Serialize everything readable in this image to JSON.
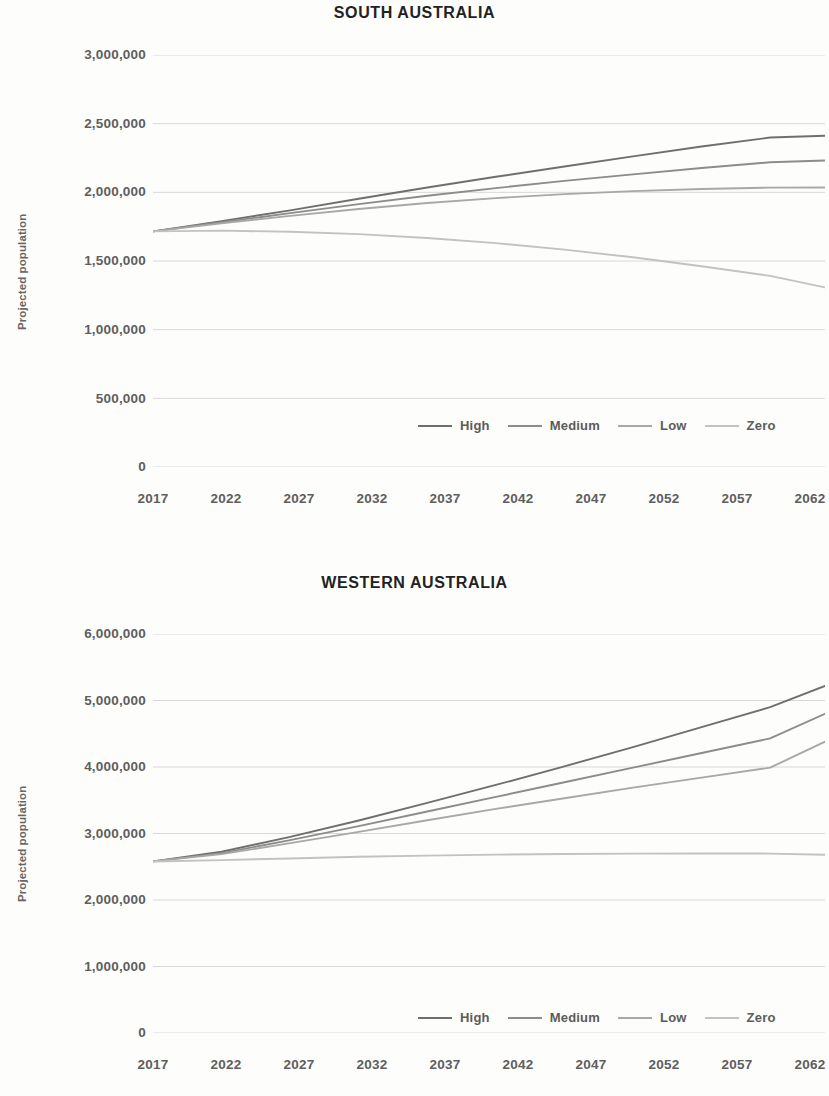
{
  "figure": {
    "background": "#fdfdfc",
    "text_color": "#5e5e5e",
    "title_color": "#222222"
  },
  "series_colors": {
    "High": "#6f6f6f",
    "Medium": "#8c8c8c",
    "Low": "#a8a8a8",
    "Zero": "#c2c2c2"
  },
  "legend": {
    "items": [
      {
        "label": "High",
        "color": "#6f6f6f"
      },
      {
        "label": "Medium",
        "color": "#8c8c8c"
      },
      {
        "label": "Low",
        "color": "#a8a8a8"
      },
      {
        "label": "Zero",
        "color": "#c2c2c2"
      }
    ]
  },
  "chart_data": [
    {
      "type": "line",
      "title": "SOUTH AUSTRALIA",
      "xlabel": "",
      "ylabel": "Projected population",
      "x": [
        2017,
        2022,
        2027,
        2032,
        2037,
        2042,
        2047,
        2052,
        2057,
        2062,
        2066
      ],
      "xticks": [
        "2017",
        "2022",
        "2027",
        "2032",
        "2037",
        "2042",
        "2047",
        "2052",
        "2057",
        "2062"
      ],
      "yticks": [
        "0",
        "500,000",
        "1,000,000",
        "1,500,000",
        "2,000,000",
        "2,500,000",
        "3,000,000"
      ],
      "ytick_values": [
        0,
        500000,
        1000000,
        1500000,
        2000000,
        2500000,
        3000000
      ],
      "xlim": [
        2017,
        2066
      ],
      "ylim": [
        0,
        3000000
      ],
      "grid": true,
      "legend_position": "bottom-center",
      "series": [
        {
          "name": "High",
          "color": "#6f6f6f",
          "values": [
            1716000,
            1790000,
            1869000,
            1953000,
            2035000,
            2113000,
            2188000,
            2262000,
            2334000,
            2399000,
            2412000
          ]
        },
        {
          "name": "Medium",
          "color": "#8c8c8c",
          "values": [
            1716000,
            1782000,
            1849000,
            1914000,
            1975000,
            2031000,
            2083000,
            2131000,
            2177000,
            2219000,
            2232000
          ]
        },
        {
          "name": "Low",
          "color": "#a8a8a8",
          "values": [
            1716000,
            1774000,
            1829000,
            1879000,
            1922000,
            1958000,
            1987000,
            2009000,
            2024000,
            2034000,
            2035000
          ]
        },
        {
          "name": "Zero",
          "color": "#c2c2c2",
          "values": [
            1716000,
            1721000,
            1713000,
            1696000,
            1668000,
            1630000,
            1583000,
            1527000,
            1462000,
            1392000,
            1308000
          ]
        }
      ]
    },
    {
      "type": "line",
      "title": "WESTERN AUSTRALIA",
      "xlabel": "",
      "ylabel": "Projected population",
      "x": [
        2017,
        2022,
        2027,
        2032,
        2037,
        2042,
        2047,
        2052,
        2057,
        2062,
        2066
      ],
      "xticks": [
        "2017",
        "2022",
        "2027",
        "2032",
        "2037",
        "2042",
        "2047",
        "2052",
        "2057",
        "2062"
      ],
      "yticks": [
        "0",
        "1,000,000",
        "2,000,000",
        "3,000,000",
        "4,000,000",
        "5,000,000",
        "6,000,000"
      ],
      "ytick_values": [
        0,
        1000000,
        2000000,
        3000000,
        4000000,
        5000000,
        6000000
      ],
      "xlim": [
        2017,
        2066
      ],
      "ylim": [
        0,
        6000000
      ],
      "grid": true,
      "legend_position": "bottom-center",
      "series": [
        {
          "name": "High",
          "color": "#6f6f6f",
          "values": [
            2580000,
            2725000,
            2950000,
            3195000,
            3460000,
            3730000,
            4010000,
            4300000,
            4600000,
            4900000,
            5220000
          ]
        },
        {
          "name": "Medium",
          "color": "#8c8c8c",
          "values": [
            2580000,
            2705000,
            2900000,
            3110000,
            3330000,
            3550000,
            3770000,
            3990000,
            4210000,
            4430000,
            4800000
          ]
        },
        {
          "name": "Low",
          "color": "#a8a8a8",
          "values": [
            2580000,
            2690000,
            2855000,
            3025000,
            3200000,
            3370000,
            3530000,
            3690000,
            3840000,
            3990000,
            4380000
          ]
        },
        {
          "name": "Zero",
          "color": "#c2c2c2",
          "values": [
            2580000,
            2600000,
            2625000,
            2650000,
            2668000,
            2682000,
            2692000,
            2698000,
            2700000,
            2698000,
            2680000
          ]
        }
      ]
    }
  ]
}
